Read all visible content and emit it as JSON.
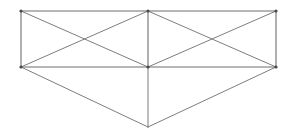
{
  "figure": {
    "type": "line-drawing",
    "canvas": {
      "width": 294,
      "height": 139,
      "background": "#ffffff"
    },
    "style": {
      "stroke_color": "#7d7d7d",
      "outline_stroke_color": "#6e6e6e",
      "stroke_width": 1,
      "vertex_dot_color": "#4a4a4a",
      "vertex_dot_radius": 1.6
    },
    "vertices": [
      {
        "id": "TL",
        "name": "top-left",
        "x": 21,
        "y": 11
      },
      {
        "id": "TM",
        "name": "top-middle",
        "x": 148,
        "y": 11
      },
      {
        "id": "TR",
        "name": "top-right",
        "x": 276,
        "y": 11
      },
      {
        "id": "ML",
        "name": "middle-left",
        "x": 21,
        "y": 67
      },
      {
        "id": "MM",
        "name": "middle-center",
        "x": 148,
        "y": 67
      },
      {
        "id": "MR",
        "name": "middle-right",
        "x": 276,
        "y": 67
      },
      {
        "id": "AP",
        "name": "bottom-apex",
        "x": 148,
        "y": 127
      }
    ],
    "edges": [
      {
        "name": "top-edge-left",
        "from": "TL",
        "to": "TM",
        "group": "outline"
      },
      {
        "name": "top-edge-right",
        "from": "TM",
        "to": "TR",
        "group": "outline"
      },
      {
        "name": "left-edge",
        "from": "TL",
        "to": "ML",
        "group": "outline"
      },
      {
        "name": "right-edge",
        "from": "TR",
        "to": "MR",
        "group": "outline"
      },
      {
        "name": "middle-edge-left",
        "from": "ML",
        "to": "MM",
        "group": "outline"
      },
      {
        "name": "middle-edge-right",
        "from": "MM",
        "to": "MR",
        "group": "outline"
      },
      {
        "name": "center-divider",
        "from": "TM",
        "to": "MM",
        "group": "outline"
      },
      {
        "name": "left-face-diagonal-a",
        "from": "TL",
        "to": "MM",
        "group": "brace"
      },
      {
        "name": "left-face-diagonal-b",
        "from": "ML",
        "to": "TM",
        "group": "brace"
      },
      {
        "name": "right-face-diagonal-a",
        "from": "TM",
        "to": "MR",
        "group": "brace"
      },
      {
        "name": "right-face-diagonal-b",
        "from": "MM",
        "to": "TR",
        "group": "brace"
      },
      {
        "name": "pyramid-left-edge",
        "from": "ML",
        "to": "AP",
        "group": "pyramid"
      },
      {
        "name": "pyramid-right-edge",
        "from": "MR",
        "to": "AP",
        "group": "pyramid"
      },
      {
        "name": "pyramid-center-edge",
        "from": "MM",
        "to": "AP",
        "group": "pyramid"
      }
    ],
    "intersections": [
      {
        "name": "left-face-x-crossing",
        "x": 85,
        "y": 39
      },
      {
        "name": "right-face-x-crossing",
        "x": 212,
        "y": 39
      }
    ],
    "regions": [
      {
        "name": "left-face",
        "description": "Left quadrilateral face with X bracing"
      },
      {
        "name": "right-face",
        "description": "Right quadrilateral face with X bracing"
      },
      {
        "name": "bottom-pyramid",
        "description": "Downward triangular pyramid below the middle edge"
      }
    ]
  }
}
